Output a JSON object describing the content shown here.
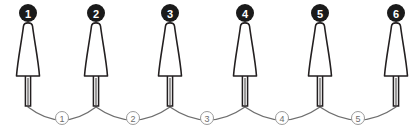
{
  "diagram": {
    "type": "spindle-chain-diagram",
    "canvas": {
      "width": 413,
      "height": 126,
      "background": "#ffffff"
    },
    "style": {
      "outline_color": "#231f20",
      "body_fill": "#ffffff",
      "arc_color": "#6e6e6e",
      "node_badge_fill": "#1a1a1a",
      "node_badge_text_color": "#ffffff",
      "link_badge_fill": "#ffffff",
      "link_badge_stroke": "#9a9a9a",
      "link_badge_text_color": "#6e6e6e"
    },
    "nodes": [
      {
        "label": "1",
        "cx": 28,
        "badge_cy": 13,
        "apex_y": 23,
        "base_y": 76,
        "apex_half_w": 4.5,
        "base_half_w": 11.5,
        "stem_bottom_y": 106,
        "stem_half_w": 2.6
      },
      {
        "label": "2",
        "cx": 96,
        "badge_cy": 13,
        "apex_y": 23,
        "base_y": 76,
        "apex_half_w": 4.5,
        "base_half_w": 11.5,
        "stem_bottom_y": 106,
        "stem_half_w": 2.6
      },
      {
        "label": "3",
        "cx": 170,
        "badge_cy": 13,
        "apex_y": 23,
        "base_y": 76,
        "apex_half_w": 4.5,
        "base_half_w": 11.5,
        "stem_bottom_y": 106,
        "stem_half_w": 2.6
      },
      {
        "label": "4",
        "cx": 245,
        "badge_cy": 13,
        "apex_y": 23,
        "base_y": 76,
        "apex_half_w": 4.5,
        "base_half_w": 11.5,
        "stem_bottom_y": 106,
        "stem_half_w": 2.6
      },
      {
        "label": "5",
        "cx": 320,
        "badge_cy": 13,
        "apex_y": 23,
        "base_y": 76,
        "apex_half_w": 4.5,
        "base_half_w": 11.5,
        "stem_bottom_y": 106,
        "stem_half_w": 2.6
      },
      {
        "label": "6",
        "cx": 396,
        "badge_cy": 13,
        "apex_y": 23,
        "base_y": 76,
        "apex_half_w": 4.5,
        "base_half_w": 11.5,
        "stem_bottom_y": 106,
        "stem_half_w": 2.6
      }
    ],
    "node_badge_radius": 9,
    "links": [
      {
        "label": "1",
        "from": "1",
        "to": "2",
        "x1": 28,
        "x2": 96,
        "y": 107,
        "sag_y": 120,
        "label_cx": 62,
        "label_cy": 118
      },
      {
        "label": "2",
        "from": "2",
        "to": "3",
        "x1": 96,
        "x2": 170,
        "y": 107,
        "sag_y": 120,
        "label_cx": 133,
        "label_cy": 118
      },
      {
        "label": "3",
        "from": "3",
        "to": "4",
        "x1": 170,
        "x2": 245,
        "y": 107,
        "sag_y": 120,
        "label_cx": 207,
        "label_cy": 118
      },
      {
        "label": "4",
        "from": "4",
        "to": "5",
        "x1": 245,
        "x2": 320,
        "y": 107,
        "sag_y": 120,
        "label_cx": 282,
        "label_cy": 118
      },
      {
        "label": "5",
        "from": "5",
        "to": "6",
        "x1": 320,
        "x2": 396,
        "y": 107,
        "sag_y": 120,
        "label_cx": 358,
        "label_cy": 118
      }
    ],
    "link_badge_radius": 6.5
  }
}
